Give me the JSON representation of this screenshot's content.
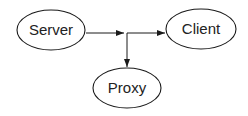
{
  "diagram": {
    "type": "flow",
    "colors": {
      "stroke": "#1a1a1a",
      "background": "#ffffff",
      "text": "#222222"
    },
    "nodes": [
      {
        "id": "server",
        "label": "Server",
        "shape": "ellipse",
        "cx": 51,
        "cy": 30
      },
      {
        "id": "client",
        "label": "Client",
        "shape": "ellipse",
        "cx": 201,
        "cy": 29
      },
      {
        "id": "proxy",
        "label": "Proxy",
        "shape": "ellipse",
        "cx": 127,
        "cy": 88
      }
    ],
    "edges": [
      {
        "from": "server",
        "to": "junction"
      },
      {
        "from": "junction",
        "to": "client"
      },
      {
        "from": "junction",
        "to": "proxy"
      }
    ]
  }
}
